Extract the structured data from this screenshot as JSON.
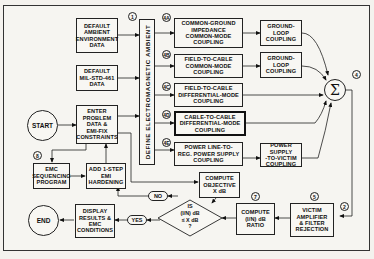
{
  "diagram": {
    "title_vertical": "DEFINE ELECTROMAGNETIC AMBIENT",
    "start": "START",
    "end": "END",
    "inputs": [
      {
        "id": "ambient-env",
        "label": "DEFAULT\nAMBIENT\nENVIRONMENT\nDATA"
      },
      {
        "id": "milstd",
        "label": "DEFAULT\nMIL-STD-461\nDATA"
      },
      {
        "id": "problem",
        "label": "ENTER\nPROBLEM\nDATA &\nEMI-FIX\nCONSTRAINTS"
      }
    ],
    "couplings": [
      {
        "tag": "4A",
        "label": "COMMON-GROUND\nIMPEDANCE\nCOMMON-MODE\nCOUPLING",
        "next": "GROUND-LOOP\nCOUPLING"
      },
      {
        "tag": "4B",
        "label": "FIELD-TO-CABLE\nCOMMON-MODE\nCOUPLING",
        "next": "GROUND-LOOP\nCOUPLING"
      },
      {
        "tag": "4C",
        "label": "FIELD-TO-CABLE\nDIFFERENTIAL-MODE\nCOUPLING"
      },
      {
        "tag": "4D",
        "label": "CABLE-TO-CABLE\nDIFFERENTIAL-MODE\nCOUPLING"
      },
      {
        "tag": "4E",
        "label": "POWER LINE-TO-\nREG. POWER SUPPLY\nCOUPLING",
        "next": "POWER SUPPLY\n-TO-VICTIM\nCOUPLING"
      }
    ],
    "sum_symbol": "Σ",
    "tags": {
      "define": "1",
      "sum": "4",
      "victim_in": "2",
      "victim": "5",
      "ratio": "7",
      "emc_seq": "8"
    },
    "victim": "VICTIM\nAMPLIFIER\n& FILTER\nREJECTION",
    "ratio": "COMPUTE\n(I/N) dB\nRATIO",
    "objective": "COMPUTE\nOBJECTIVE\nX dB",
    "decision": "IS\n(I/N) dB\n≤ X dB\n?",
    "no": "NO",
    "yes": "YES",
    "hardening": "ADD 1-STEP\nEMI\nHARDENING",
    "emc_sequencing": "EMC\nSEQUENCING\nPROGRAM",
    "display": "DISPLAY\nRESULTS &\nEMC\nCONDITIONS"
  }
}
